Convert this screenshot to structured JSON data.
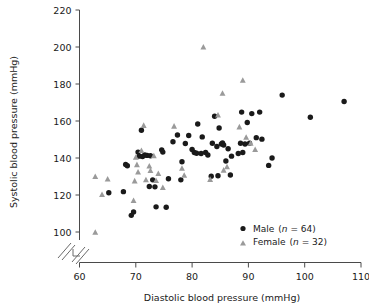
{
  "chart_data": {
    "type": "scatter",
    "title": "",
    "xlabel": "Diastolic blood pressure (mmHg)",
    "ylabel": "Systolic blood pressure (mmHg)",
    "xlim": [
      60,
      110
    ],
    "ylim": [
      100,
      220
    ],
    "xticks": [
      60,
      70,
      80,
      90,
      100,
      110
    ],
    "yticks": [
      100,
      120,
      140,
      160,
      180,
      200,
      220
    ],
    "grid": false,
    "axis_break": {
      "axis": "both",
      "note": "broken axis symbol at origin corner"
    },
    "legend_position": "bottom-right",
    "series": [
      {
        "name": "Male",
        "count": 64,
        "marker": "circle",
        "color": "#1a1a1a",
        "legend_label": "Male (n = 64)",
        "points": [
          [
            65.2,
            121.2
          ],
          [
            67.8,
            121.8
          ],
          [
            68.2,
            136.5
          ],
          [
            68.5,
            135.8
          ],
          [
            69.6,
            110.8
          ],
          [
            69.2,
            109.0
          ],
          [
            70.4,
            143.2
          ],
          [
            70.6,
            141.0
          ],
          [
            71.2,
            140.8
          ],
          [
            71.0,
            155.0
          ],
          [
            71.6,
            141.6
          ],
          [
            72.0,
            141.4
          ],
          [
            72.4,
            124.6
          ],
          [
            72.6,
            141.2
          ],
          [
            73.0,
            128.2
          ],
          [
            73.4,
            124.4
          ],
          [
            73.6,
            113.6
          ],
          [
            74.6,
            144.4
          ],
          [
            74.8,
            143.2
          ],
          [
            75.4,
            113.4
          ],
          [
            75.8,
            128.8
          ],
          [
            76.6,
            148.8
          ],
          [
            77.4,
            152.4
          ],
          [
            78.0,
            128.2
          ],
          [
            78.2,
            138.0
          ],
          [
            78.8,
            147.8
          ],
          [
            79.4,
            152.2
          ],
          [
            80.0,
            144.6
          ],
          [
            80.4,
            143.0
          ],
          [
            80.8,
            142.6
          ],
          [
            81.0,
            158.4
          ],
          [
            81.6,
            142.4
          ],
          [
            81.8,
            151.4
          ],
          [
            82.4,
            143.0
          ],
          [
            82.8,
            141.6
          ],
          [
            83.4,
            130.2
          ],
          [
            83.6,
            148.0
          ],
          [
            84.0,
            162.6
          ],
          [
            84.4,
            146.2
          ],
          [
            84.8,
            156.2
          ],
          [
            85.2,
            147.6
          ],
          [
            85.4,
            148.2
          ],
          [
            85.6,
            147.0
          ],
          [
            86.0,
            138.4
          ],
          [
            86.4,
            145.0
          ],
          [
            86.8,
            130.8
          ],
          [
            88.2,
            142.4
          ],
          [
            88.6,
            148.0
          ],
          [
            88.8,
            164.8
          ],
          [
            89.0,
            143.0
          ],
          [
            89.4,
            147.6
          ],
          [
            89.8,
            159.2
          ],
          [
            90.2,
            148.0
          ],
          [
            90.6,
            164.0
          ],
          [
            91.4,
            151.0
          ],
          [
            92.0,
            164.8
          ],
          [
            92.4,
            150.2
          ],
          [
            93.6,
            136.0
          ],
          [
            94.2,
            140.0
          ],
          [
            96.0,
            174.0
          ],
          [
            101.0,
            162.0
          ],
          [
            107.0,
            170.5
          ],
          [
            87.0,
            141.0
          ],
          [
            84.6,
            130.4
          ]
        ]
      },
      {
        "name": "Female",
        "count": 32,
        "marker": "triangle",
        "color": "#9a9a9a",
        "legend_label": "Female (n = 32)",
        "points": [
          [
            62.8,
            130.0
          ],
          [
            62.8,
            99.8
          ],
          [
            64.0,
            120.2
          ],
          [
            65.0,
            128.6
          ],
          [
            69.6,
            117.0
          ],
          [
            69.8,
            127.6
          ],
          [
            70.0,
            140.4
          ],
          [
            70.2,
            136.4
          ],
          [
            70.4,
            132.4
          ],
          [
            71.0,
            144.0
          ],
          [
            71.4,
            157.6
          ],
          [
            71.8,
            128.2
          ],
          [
            72.4,
            135.6
          ],
          [
            72.6,
            133.2
          ],
          [
            73.2,
            141.2
          ],
          [
            73.6,
            127.8
          ],
          [
            74.0,
            131.6
          ],
          [
            76.8,
            157.2
          ],
          [
            78.2,
            134.4
          ],
          [
            78.6,
            130.6
          ],
          [
            82.0,
            200.0
          ],
          [
            84.6,
            163.2
          ],
          [
            85.4,
            175.0
          ],
          [
            85.6,
            133.4
          ],
          [
            86.2,
            135.2
          ],
          [
            88.4,
            156.8
          ],
          [
            89.0,
            182.0
          ],
          [
            89.6,
            151.2
          ],
          [
            90.4,
            148.0
          ],
          [
            91.2,
            144.6
          ],
          [
            83.2,
            128.4
          ],
          [
            74.8,
            124.0
          ]
        ]
      }
    ]
  },
  "legend": {
    "male_name": "Male",
    "male_n": "(n = 64)",
    "female_name": "Female",
    "female_n": "(n = 32)",
    "n_prefix": "n",
    "male_n_value": " = 64)",
    "female_n_value": " = 32)"
  }
}
